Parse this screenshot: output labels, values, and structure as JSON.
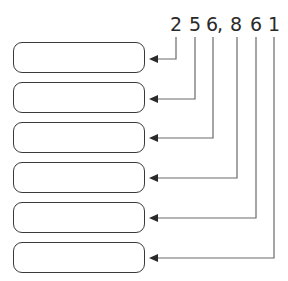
{
  "number": {
    "display": "256,861",
    "digits": [
      {
        "char": "2",
        "x": 176
      },
      {
        "char": "5",
        "x": 195
      },
      {
        "char": "6",
        "x": 212
      },
      {
        "char": ",",
        "x": 222
      },
      {
        "char": "8",
        "x": 236
      },
      {
        "char": "6",
        "x": 256
      },
      {
        "char": "1",
        "x": 274
      }
    ]
  },
  "boxes": [
    {
      "label": "",
      "top": 42,
      "arrow_y": 59,
      "line_x": 176
    },
    {
      "label": "",
      "top": 82,
      "arrow_y": 99,
      "line_x": 195
    },
    {
      "label": "",
      "top": 122,
      "arrow_y": 138,
      "line_x": 213
    },
    {
      "label": "",
      "top": 162,
      "arrow_y": 178,
      "line_x": 237
    },
    {
      "label": "",
      "top": 202,
      "arrow_y": 218,
      "line_x": 256
    },
    {
      "label": "",
      "top": 242,
      "arrow_y": 258,
      "line_x": 274
    }
  ],
  "colors": {
    "line": "#6a6a6a",
    "box_border": "#3a3a3a",
    "text": "#2a2a2a"
  }
}
